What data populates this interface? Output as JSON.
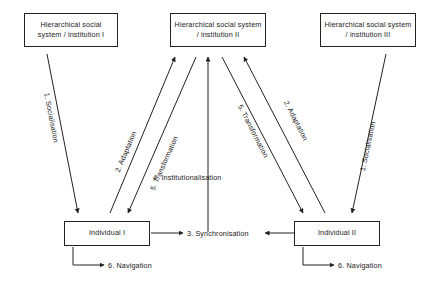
{
  "diagram": {
    "title_nodes": {
      "institution_1": "Hierarchical social system / institution I",
      "institution_2": "Hierarchical social system / institution II",
      "institution_3": "Hierarchical social system / institution III"
    },
    "actor_nodes": {
      "individual_1": "Individual I",
      "individual_2": "Individual II"
    },
    "edges": {
      "socialisation_left": "1. Socialisation",
      "adaptation_left": "2. Adaptation",
      "transformation_left": "5. Transformation",
      "transformation_right": "5. Transformation",
      "adaptation_right": "2. Adaptation",
      "socialisation_right": "1. Socialisation",
      "institutionalisation": "4. Institutionalisation",
      "synchronisation": "3. Synchronisation",
      "navigation_left": "6. Navigation",
      "navigation_right": "6. Navigation"
    },
    "colors": {
      "stroke": "#222222",
      "text": "#1a1a1a",
      "background": "#ffffff"
    }
  }
}
